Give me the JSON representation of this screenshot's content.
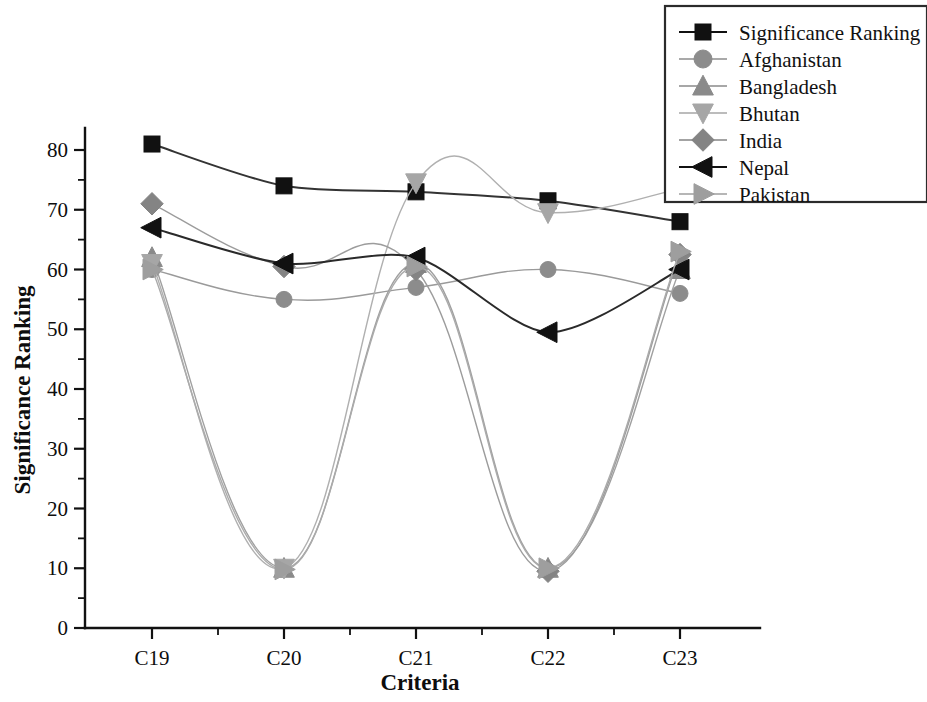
{
  "chart_data": {
    "type": "line",
    "title": "",
    "xlabel": "Criteria",
    "ylabel": "Significance Ranking",
    "categories": [
      "C19",
      "C20",
      "C21",
      "C22",
      "C23"
    ],
    "ylim": [
      0,
      85
    ],
    "yticks": [
      0,
      10,
      20,
      30,
      40,
      50,
      60,
      70,
      80
    ],
    "ytick_labels": [
      "0",
      "10",
      "20",
      "30",
      "40",
      "50",
      "60",
      "70",
      "80"
    ],
    "minor_ticks": true,
    "grid": false,
    "legend_position": "top-right",
    "series": [
      {
        "name": "Significance Ranking",
        "marker": "square",
        "color": "#111111",
        "line_color": "#333333",
        "values": [
          81,
          74,
          73,
          71.5,
          68
        ]
      },
      {
        "name": "Afghanistan",
        "marker": "circle",
        "color": "#8c8c8c",
        "line_color": "#9a9a9a",
        "values": [
          60,
          55,
          57,
          60,
          56
        ]
      },
      {
        "name": "Bangladesh",
        "marker": "triangle-up",
        "color": "#8a8a8a",
        "line_color": "#a0a0a0",
        "values": [
          62,
          10,
          61,
          10,
          60
        ]
      },
      {
        "name": "Bhutan",
        "marker": "triangle-down",
        "color": "#a6a6a6",
        "line_color": "#b0b0b0",
        "values": [
          61,
          10,
          74.5,
          69.5,
          73.5
        ]
      },
      {
        "name": "India",
        "marker": "diamond",
        "color": "#848484",
        "line_color": "#9c9c9c",
        "values": [
          71,
          60.5,
          60,
          9.5,
          62.5
        ]
      },
      {
        "name": "Nepal",
        "marker": "triangle-left",
        "color": "#111111",
        "line_color": "#2a2a2a",
        "values": [
          67,
          61,
          62,
          49.5,
          60
        ]
      },
      {
        "name": "Pakistan",
        "marker": "triangle-right",
        "color": "#9e9e9e",
        "line_color": "#ababab",
        "values": [
          60,
          9.8,
          60.5,
          10,
          63
        ]
      }
    ]
  },
  "axes": {
    "y_axis_title": "Significance Ranking",
    "x_axis_title": "Criteria"
  },
  "legend": {
    "entries": [
      {
        "label": "Significance Ranking",
        "marker": "square",
        "color": "#111111"
      },
      {
        "label": "Afghanistan",
        "marker": "circle",
        "color": "#8c8c8c"
      },
      {
        "label": "Bangladesh",
        "marker": "triangle-up",
        "color": "#8a8a8a"
      },
      {
        "label": "Bhutan",
        "marker": "triangle-down",
        "color": "#a6a6a6"
      },
      {
        "label": "India",
        "marker": "diamond",
        "color": "#848484"
      },
      {
        "label": "Nepal",
        "marker": "triangle-left",
        "color": "#111111"
      },
      {
        "label": "Pakistan",
        "marker": "triangle-right",
        "color": "#9e9e9e"
      }
    ]
  }
}
